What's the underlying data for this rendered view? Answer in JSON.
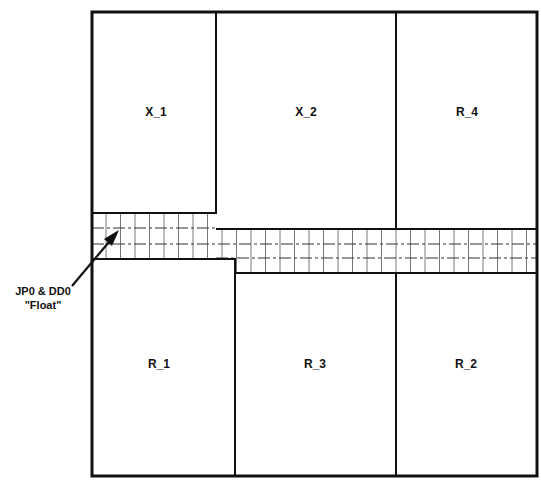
{
  "diagram": {
    "regions": [
      {
        "id": "x1",
        "label": "X_1"
      },
      {
        "id": "x2",
        "label": "X_2"
      },
      {
        "id": "r4",
        "label": "R_4"
      },
      {
        "id": "r1",
        "label": "R_1"
      },
      {
        "id": "r3",
        "label": "R_3"
      },
      {
        "id": "r2",
        "label": "R_2"
      }
    ],
    "annotation": {
      "line1": "JP0 & DD0",
      "line2": "\"Float\""
    },
    "colors": {
      "stroke": "#111111",
      "background": "#ffffff"
    }
  }
}
